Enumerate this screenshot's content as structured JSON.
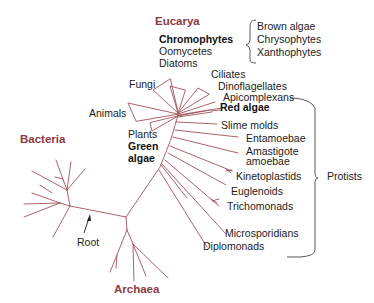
{
  "colors": {
    "branch": "#a0525a",
    "domain_label": "#8b3a42",
    "text": "#222222",
    "bracket": "#444444"
  },
  "domains": {
    "eucarya": "Eucarya",
    "bacteria": "Bacteria",
    "archaea": "Archaea"
  },
  "chromophytes": {
    "label": "Chromophytes",
    "members": [
      "Brown algae",
      "Chrysophytes",
      "Xanthophytes"
    ],
    "siblings": [
      "Oomycetes",
      "Diatoms"
    ]
  },
  "groups": {
    "fungi": "Fungi",
    "animals": "Animals",
    "plants": "Plants",
    "green_algae_1": "Green",
    "green_algae_2": "algae"
  },
  "protists": {
    "label": "Protists",
    "members": [
      "Ciliates",
      "Dinoflagellates",
      "Apicomplexans",
      "Red algae",
      "Slime molds",
      "Entamoebae",
      "Amastigote",
      "amoebae",
      "Kinetoplastids",
      "Euglenoids",
      "Trichomonads",
      "Microsporidians",
      "Diplomonads"
    ]
  },
  "root": {
    "label": "Root"
  }
}
